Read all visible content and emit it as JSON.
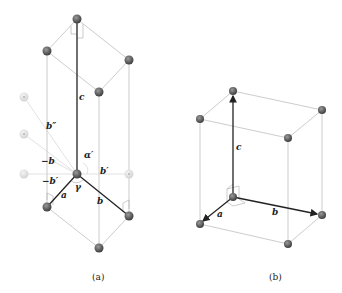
{
  "figure": {
    "panels": [
      {
        "id": "a",
        "caption": "(a)",
        "labels": {
          "c": "c",
          "a": "a",
          "b": "b",
          "b_lower": "b",
          "b_prime": "b′",
          "neg_b": "−b",
          "neg_b_prime": "−b′",
          "b_double_prime": "b″",
          "alpha_prime": "α′",
          "gamma": "γ"
        }
      },
      {
        "id": "b",
        "caption": "(b)",
        "labels": {
          "c": "c",
          "a": "a",
          "b": "b"
        }
      }
    ],
    "colors": {
      "atom": "#555555",
      "atom_faint": "#dddddd",
      "axis": "#222222",
      "edge": "#aaaaaa"
    }
  }
}
